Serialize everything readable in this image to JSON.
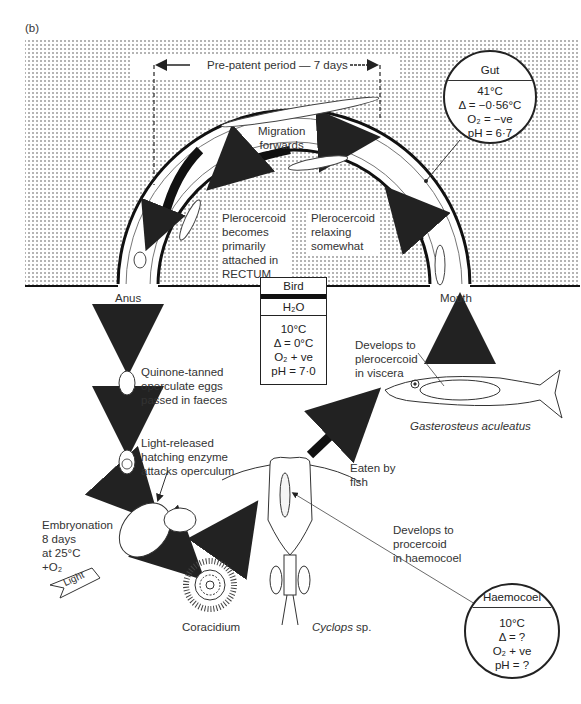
{
  "figure": {
    "panel_label": "(b)",
    "pre_patent": "Pre-patent period — 7 days",
    "migration": [
      "Migration",
      "forwards"
    ],
    "plero_rectum": [
      "Plerocercoid",
      "becomes",
      "primarily",
      "attached in",
      "RECTUM"
    ],
    "plero_relax": [
      "Plerocercoid",
      "relaxing",
      "somewhat"
    ],
    "anus": "Anus",
    "mouth": "Mouth",
    "eggs": [
      "Quinone-tanned",
      "operculate eggs",
      "passed in faeces"
    ],
    "hatching": [
      "Light-released",
      "hatching enzyme",
      "attacks operculum"
    ],
    "embryonation": [
      "Embryonation",
      "8 days",
      "at 25°C",
      "+O₂"
    ],
    "light": "Light",
    "coracidium": "Coracidium",
    "cyclops": "Cyclops",
    "cyclops_sp": " sp.",
    "eaten": [
      "Eaten by",
      "fish"
    ],
    "fish_label": "Gasterosteus aculeatus",
    "develops_plero": [
      "Develops to",
      "plerocercoid",
      "in viscera"
    ],
    "develops_proc": [
      "Develops to",
      "procercoid",
      "in haemocoel"
    ]
  },
  "gut_circle": {
    "title": "Gut",
    "lines": [
      "41°C",
      "Δ = −0·56°C",
      "O₂ = −ve",
      "pH = 6·7"
    ]
  },
  "bird_box": {
    "bird": "Bird",
    "water": "H₂O",
    "lines": [
      "10°C",
      "Δ = 0°C",
      "O₂ + ve",
      "pH = 7·0"
    ]
  },
  "haemocoel_circle": {
    "title": "Haemocoel",
    "lines": [
      "10°C",
      "Δ = ?",
      "O₂ + ve",
      "pH = ?"
    ]
  }
}
